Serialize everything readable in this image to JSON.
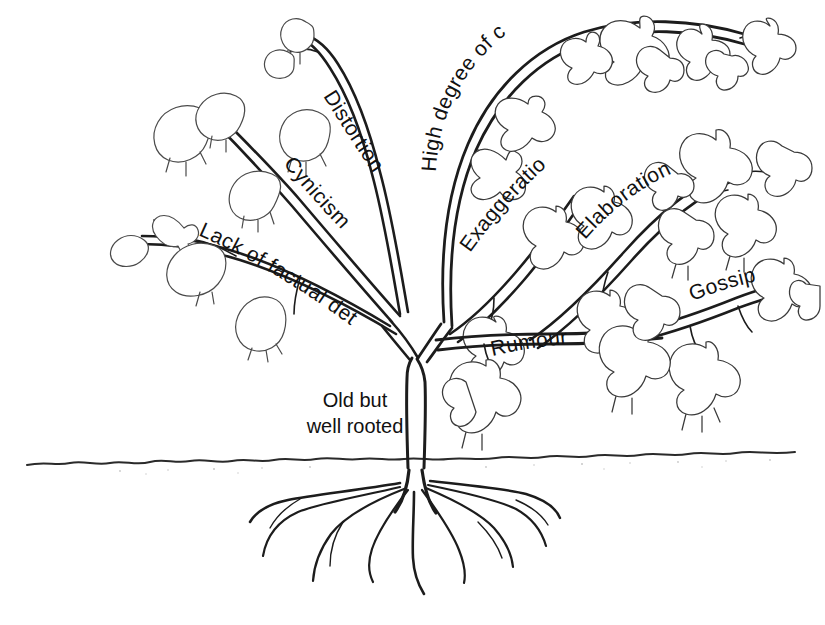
{
  "figure": {
    "title": "Rumour tree diagram",
    "background_color": "#ffffff",
    "ink_color": "#1c1c1c",
    "leaf_outline_color": "#3a3a3a",
    "style": "hand-drawn black-and-white line illustration"
  },
  "labels": {
    "distortion": "Distortion",
    "cynicism": "Cynicism",
    "lack_of_factual_detail": "Lack of factual detail",
    "high_degree_of_credibility": "High degree of credibility",
    "exaggeration": "Exaggeration",
    "elaboration": "Elaboration",
    "gossip": "Gossip",
    "rumour": "Rumour",
    "old_but_well_rooted": "Old but\nwell rooted"
  },
  "branches": [
    {
      "id": "distortion",
      "label": "Distortion",
      "side": "left",
      "foliage": "wilted",
      "leaf_count": 3
    },
    {
      "id": "cynicism",
      "label": "Cynicism",
      "side": "left",
      "foliage": "wilted",
      "leaf_count": 2
    },
    {
      "id": "lack-of-factual-detail",
      "label": "Lack of factual detail",
      "side": "left",
      "foliage": "wilted",
      "leaf_count": 4
    },
    {
      "id": "high-degree-of-credibility",
      "label": "High degree of credibility",
      "side": "right",
      "foliage": "full",
      "leaf_count": 8
    },
    {
      "id": "exaggeration",
      "label": "Exaggeration",
      "side": "right",
      "foliage": "full",
      "leaf_count": 3
    },
    {
      "id": "elaboration",
      "label": "Elaboration",
      "side": "right",
      "foliage": "full",
      "leaf_count": 6
    },
    {
      "id": "gossip",
      "label": "Gossip",
      "side": "right",
      "foliage": "full",
      "leaf_count": 4
    },
    {
      "id": "rumour",
      "label": "Rumour",
      "side": "right",
      "foliage": "full",
      "leaf_count": 2
    }
  ],
  "trunk": {
    "label": "Old but\nwell rooted",
    "ground_label": ""
  },
  "roots": {
    "count": 9,
    "description": "deep fibrous root system below ground line"
  }
}
